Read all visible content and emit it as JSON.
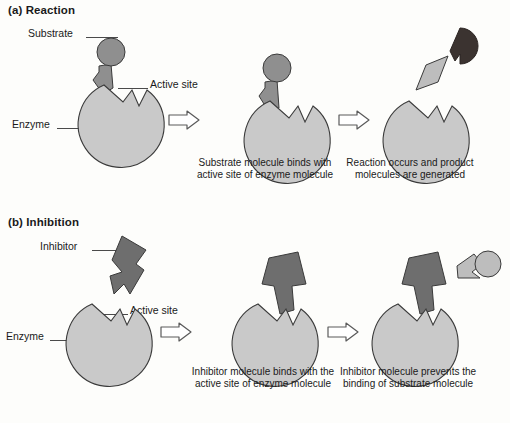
{
  "figure": {
    "kind": "enzyme-action-diagram",
    "colors": {
      "enzyme_fill": "#c9c9c9",
      "substrate_fill": "#8f8f8f",
      "inhibitor_fill": "#6e6e6e",
      "product_dark_fill": "#3b3330",
      "product_light_fill": "#bdbdbd",
      "outline": "#3a3a3a",
      "leader_line": "#4a4a4a",
      "arrow_outline": "#5a5a5a",
      "background": "#fdfdfb",
      "text": "#1a1a1a"
    }
  },
  "sections": [
    {
      "id": "reaction",
      "title": "(a) Reaction",
      "labels": [
        {
          "name": "substrate",
          "text": "Substrate"
        },
        {
          "name": "active-site",
          "text": "Active site"
        },
        {
          "name": "enzyme",
          "text": "Enzyme"
        }
      ],
      "steps": [
        {
          "index": 1,
          "caption": ""
        },
        {
          "index": 2,
          "caption": "Substrate molecule binds with active site of enzyme molecule"
        },
        {
          "index": 3,
          "caption": "Reaction occurs and product molecules are generated"
        }
      ],
      "arrows": [
        {
          "name": "step-arrow-1",
          "glyph": "right-arrow-icon"
        },
        {
          "name": "step-arrow-2",
          "glyph": "right-arrow-icon"
        }
      ]
    },
    {
      "id": "inhibition",
      "title": "(b) Inhibition",
      "labels": [
        {
          "name": "inhibitor",
          "text": "Inhibitor"
        },
        {
          "name": "active-site",
          "text": "Active site"
        },
        {
          "name": "enzyme",
          "text": "Enzyme"
        }
      ],
      "steps": [
        {
          "index": 1,
          "caption": ""
        },
        {
          "index": 2,
          "caption": "Inhibitor molecule binds with the active site of enzyme molecule"
        },
        {
          "index": 3,
          "caption": "Inhibitor molecule prevents the binding of substrate molecule"
        }
      ],
      "arrows": [
        {
          "name": "step-arrow-1",
          "glyph": "right-arrow-icon"
        },
        {
          "name": "step-arrow-2",
          "glyph": "right-arrow-icon"
        }
      ]
    }
  ]
}
